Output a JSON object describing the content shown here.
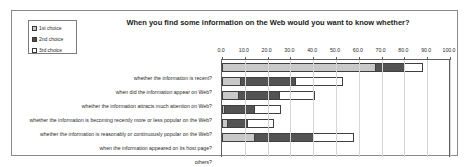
{
  "chart_data": {
    "type": "bar",
    "title": "When you find some information on the Web would you want to know whether?",
    "xlabel": "",
    "ylabel": "",
    "orientation": "horizontal",
    "stacked": true,
    "xlim": [
      0,
      100
    ],
    "grid": true,
    "legend_position": "top-left",
    "tick_labels": [
      "0.0",
      "10.0",
      "20.0",
      "30.0",
      "40.0",
      "50.0",
      "60.0",
      "70.0",
      "80.0",
      "90.0",
      "100.0"
    ],
    "ticks": [
      0,
      10,
      20,
      30,
      40,
      50,
      60,
      70,
      80,
      90,
      100
    ],
    "categories": [
      "whether the information is recent?",
      "when did the information appear on Web?",
      "whether the information attracts much attention on Web?",
      "whether the information is becoming recently more or less popular on the Web?",
      "whether the information is reasonably or continuously popular on the Web?",
      "when the information appeared on its host page?",
      "others?"
    ],
    "series": [
      {
        "name": "1st choice",
        "color": "#c9c9c9",
        "values": [
          67,
          8,
          7,
          1,
          2,
          14,
          0
        ]
      },
      {
        "name": "2nd choice",
        "color": "#535353",
        "values": [
          13,
          24,
          18,
          13,
          9,
          26,
          0
        ]
      },
      {
        "name": "3rd choice",
        "color": "#ffffff",
        "values": [
          8,
          21,
          16,
          12,
          12,
          18,
          0
        ]
      }
    ],
    "totals": [
      88,
      53,
      41,
      26,
      23,
      58,
      0
    ]
  },
  "legend": {
    "items": [
      {
        "label": "1st choice"
      },
      {
        "label": "2nd choice"
      },
      {
        "label": "3rd choice"
      }
    ]
  }
}
